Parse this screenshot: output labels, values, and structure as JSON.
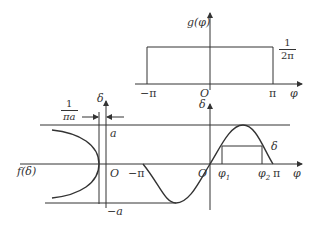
{
  "top_plot": {
    "y_label": "g(φ)",
    "x_label": "φ",
    "origin_label": "O",
    "tick_neg_pi": "−π",
    "tick_pi": "π",
    "level_numerator": "1",
    "level_denominator": "2π",
    "description": "Uniform density g(φ)=1/(2π) on [−π, π]"
  },
  "bottom_left_plot": {
    "y_label": "δ",
    "x_label": "f(δ)",
    "origin_label": "O",
    "tick_a": "a",
    "tick_neg_a": "−a",
    "min_width_numerator": "1",
    "min_width_denominator": "πa",
    "description": "Density f(δ) of δ = a sin φ, arcsine shape"
  },
  "bottom_right_plot": {
    "y_label": "δ",
    "x_label": "φ",
    "origin_label": "O",
    "tick_neg_pi": "−π",
    "tick_pi": "π",
    "tick_phi1": "φ",
    "tick_phi1_sub": "1",
    "tick_phi2": "φ",
    "tick_phi2_sub": "2",
    "curve_label": "δ",
    "description": "δ = a sin φ for φ in [−π, π]"
  }
}
